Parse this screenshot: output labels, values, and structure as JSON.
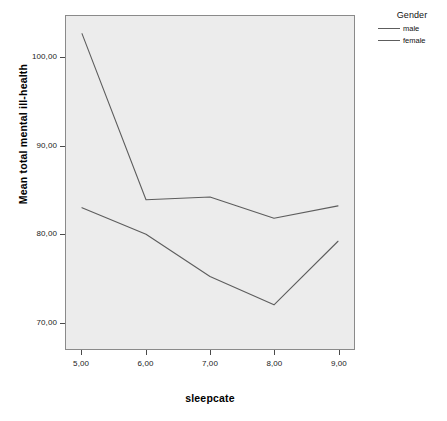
{
  "chart_data": {
    "type": "line",
    "title": "",
    "xlabel": "sleepcate",
    "ylabel": "Mean total mental ill-health",
    "x": [
      5,
      6,
      7,
      8,
      9
    ],
    "xtick_labels": [
      "5,00",
      "6,00",
      "7,00",
      "8,00",
      "9,00"
    ],
    "ytick_labels": [
      "70,00",
      "80,00",
      "90,00",
      "100,00"
    ],
    "ytick_values": [
      70,
      80,
      90,
      100
    ],
    "xlim": [
      4.75,
      9.25
    ],
    "ylim": [
      67.0,
      104.7
    ],
    "grid": false,
    "legend_position": "right",
    "legend_title": "Gender",
    "series": [
      {
        "name": "male",
        "color": "#5d5d5d",
        "values": [
          83.0,
          80.0,
          75.2,
          72.0,
          79.2
        ]
      },
      {
        "name": "female",
        "color": "#5d5d5d",
        "values": [
          102.7,
          83.9,
          84.2,
          81.8,
          83.2
        ]
      }
    ],
    "plot_background": "#ececec",
    "frame_color": "#8a8a8a",
    "page_background": "#ffffff"
  },
  "legend": {
    "title": "Gender",
    "items": [
      {
        "label": "male"
      },
      {
        "label": "female"
      }
    ]
  },
  "axes": {
    "x_title": "sleepcate",
    "y_title": "Mean total mental ill-health"
  }
}
